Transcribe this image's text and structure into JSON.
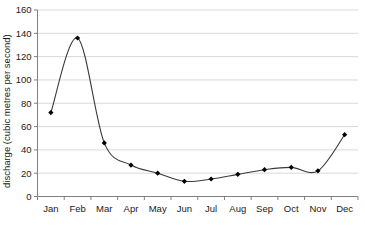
{
  "chart_data": {
    "type": "line",
    "title": "",
    "subtitle": "",
    "xlabel": "",
    "ylabel": "discharge (cubic metres per second)",
    "categories": [
      "Jan",
      "Feb",
      "Mar",
      "Apr",
      "May",
      "Jun",
      "Jul",
      "Aug",
      "Sep",
      "Oct",
      "Nov",
      "Dec"
    ],
    "values": [
      72,
      136,
      46,
      27,
      20,
      13,
      15,
      19,
      23,
      25,
      22,
      53
    ],
    "series": [
      {
        "name": "discharge",
        "values": [
          72,
          136,
          46,
          27,
          20,
          13,
          15,
          19,
          23,
          25,
          22,
          53
        ]
      }
    ],
    "ylim": [
      0,
      160
    ],
    "ytick_labels": [
      "0",
      "20",
      "40",
      "60",
      "80",
      "100",
      "120",
      "140",
      "160"
    ],
    "ytick_values": [
      0,
      20,
      40,
      60,
      80,
      100,
      120,
      140,
      160
    ],
    "xtick_labels": [
      "Jan",
      "Feb",
      "Mar",
      "Apr",
      "May",
      "Jun",
      "Jul",
      "Aug",
      "Sep",
      "Oct",
      "Nov",
      "Dec"
    ],
    "grid": "horizontal",
    "legend": "none",
    "line_color": "#3a3a3a",
    "marker_color": "#000000",
    "marker_shape": "diamond",
    "grid_color": "#d9d9d9",
    "axis_color": "#808080",
    "text_color": "#1a1a1a",
    "background_color": "#ffffff",
    "smoothing": "spline"
  }
}
